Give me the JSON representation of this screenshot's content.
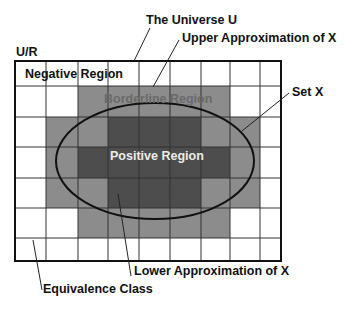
{
  "labels": {
    "universe": "The Universe U",
    "upper_approx": "Upper Approximation of X",
    "ur": "U/R",
    "negative": "Negative Region",
    "borderline": "Borderline Region",
    "set_x": "Set X",
    "positive": "Positive Region",
    "lower_approx": "Lower Approximation of X",
    "equivalence": "Equivalence Class"
  },
  "colors": {
    "negative": "#ffffff",
    "borderline": "#8c8c8c",
    "positive": "#4d4d4d",
    "borderline_text": "#6a6a6a",
    "positive_text": "#e8e8e8",
    "lines": "#111111"
  },
  "grid": {
    "columns": 9,
    "rows": 7,
    "col_edges": [
      15,
      46,
      78,
      108,
      139,
      170,
      201,
      230,
      260,
      281
    ],
    "row_edges": [
      61,
      86,
      117,
      147,
      178,
      208,
      238,
      261
    ],
    "cells": [
      [
        0,
        0,
        0,
        0,
        0,
        0,
        0,
        0,
        0
      ],
      [
        0,
        0,
        1,
        1,
        1,
        1,
        1,
        0,
        0
      ],
      [
        0,
        1,
        1,
        2,
        2,
        2,
        1,
        1,
        0
      ],
      [
        0,
        1,
        2,
        2,
        2,
        2,
        2,
        1,
        0
      ],
      [
        0,
        1,
        1,
        2,
        2,
        2,
        1,
        1,
        0
      ],
      [
        0,
        0,
        1,
        1,
        1,
        1,
        1,
        0,
        0
      ],
      [
        0,
        0,
        0,
        0,
        0,
        0,
        0,
        0,
        0
      ]
    ],
    "legend": {
      "0": "negative",
      "1": "borderline",
      "2": "positive"
    }
  },
  "ellipse": {
    "cx": 155,
    "cy": 161,
    "rx": 99,
    "ry": 58
  }
}
